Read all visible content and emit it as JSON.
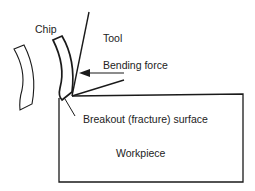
{
  "diagram": {
    "labels": {
      "chip": "Chip",
      "tool": "Tool",
      "bending_force": "Bending force",
      "breakout_surface": "Breakout (fracture) surface",
      "workpiece": "Workpiece"
    },
    "colors": {
      "line": "#1a1a1a",
      "background": "#ffffff"
    }
  }
}
